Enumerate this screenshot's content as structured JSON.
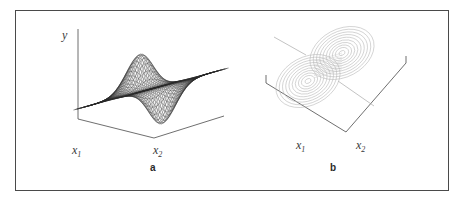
{
  "figure": {
    "background_color": "#ffffff",
    "frame_color": "#4a4a4a",
    "panels": [
      {
        "id": "a",
        "letter": "a",
        "kind": "surface-3d-wireframe",
        "y_axis_label": "y",
        "x1_label": "x",
        "x1_sub": "1",
        "x2_label": "x",
        "x2_sub": "2",
        "mesh_color": "#2a2a2a"
      },
      {
        "id": "b",
        "letter": "b",
        "kind": "contour-plot",
        "x1_label": "x",
        "x1_sub": "1",
        "x2_label": "x",
        "x2_sub": "2",
        "contour_color": "#b9b9b9"
      }
    ]
  },
  "chart_data": [
    {
      "type": "surface",
      "panel": "a",
      "title": "",
      "xlabel": "x1",
      "ylabel": "x2",
      "zlabel": "y",
      "grid": false,
      "legend": "none",
      "function": "derivative-of-gaussian saddle: y = x1 * exp(-(x1^2 + x2^2))",
      "x": [
        -2.5,
        -2.0,
        -1.5,
        -1.0,
        -0.5,
        0.0,
        0.5,
        1.0,
        1.5,
        2.0,
        2.5
      ],
      "y": [
        -2.5,
        -2.0,
        -1.5,
        -1.0,
        -0.5,
        0.0,
        0.5,
        1.0,
        1.5,
        2.0,
        2.5
      ],
      "zlim": [
        -0.45,
        0.45
      ],
      "peak_value": 0.43,
      "valley_value": -0.43,
      "peak_location": [
        -0.71,
        0.0
      ],
      "valley_location": [
        0.71,
        0.0
      ],
      "mesh_rows": 45,
      "mesh_cols": 45
    },
    {
      "type": "contour",
      "panel": "b",
      "title": "",
      "xlabel": "x1",
      "ylabel": "x2",
      "grid": false,
      "legend": "none",
      "function": "derivative-of-gaussian saddle: y = x1 * exp(-(x1^2 + x2^2))",
      "levels": [
        -0.4,
        -0.35,
        -0.3,
        -0.25,
        -0.2,
        -0.15,
        -0.1,
        -0.05,
        0.0,
        0.05,
        0.1,
        0.15,
        0.2,
        0.25,
        0.3,
        0.35,
        0.4
      ],
      "xlim": [
        -2.5,
        2.5
      ],
      "ylim": [
        -2.5,
        2.5
      ],
      "lobes": [
        {
          "sign": "positive",
          "center": [
            -0.71,
            0.0
          ],
          "extremum": 0.43,
          "rings": 9
        },
        {
          "sign": "negative",
          "center": [
            0.71,
            0.0
          ],
          "extremum": -0.43,
          "rings": 9
        }
      ]
    }
  ]
}
